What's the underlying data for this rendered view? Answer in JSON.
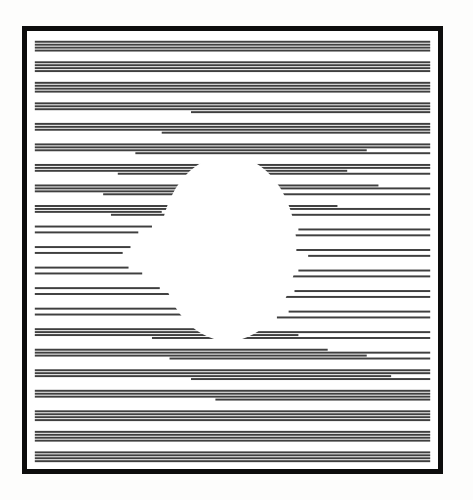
{
  "artwork": {
    "title": "Horizontal Line Optical Illusion",
    "description": "Black rectangular frame enclosing stacked horizontal line pairs that part around a central oval void, producing a sphere-like figure-ground illusion.",
    "style_name": "op-art-line-drawing",
    "canvas": {
      "width": 473,
      "height": 500,
      "background_color": "#fdfdfc"
    },
    "frame": {
      "name": "black-rectangular-border",
      "left": 22,
      "top": 26,
      "width": 421,
      "height": 448,
      "border_width": 5,
      "border_color": "#0d0d0d",
      "inner_inset": 3,
      "fill_color": "#ffffff"
    },
    "plate": {
      "left": 30,
      "top": 34,
      "width": 405,
      "height": 432,
      "background_color": "#ffffff"
    },
    "stripes": {
      "name": "horizontal-stripe-field",
      "color": "#3f3f3f",
      "thickness": 2,
      "pair_gap": 4,
      "group_gap": 11,
      "group_count": 28,
      "lines_per_group": 2,
      "first_group_top": 36
    },
    "void": {
      "name": "central-oval-void",
      "shape": "oval",
      "center_x": 228,
      "center_y": 248,
      "radius_x": 70,
      "radius_y": 95,
      "fill_color": "#ffffff",
      "top_notch_depth": 18,
      "bottom_notch_depth": 14
    },
    "chart_data": {
      "type": "line",
      "title": "Horizontal Line Optical Illusion",
      "xlabel": "",
      "ylabel": "",
      "xlim": [
        30,
        435
      ],
      "ylim": [
        34,
        466
      ],
      "grid": false,
      "legend": "none",
      "note": "Each row is a pair of stripes. left_end = x where the left-anchored stripe stops; right_start = x where the right-anchored stripe begins. Full-width rows use left_end 435 and right_start 30.",
      "rows": [
        {
          "y": 36,
          "left_end": 435,
          "right_start": 30
        },
        {
          "y": 42,
          "left_end": 435,
          "right_start": 30
        },
        {
          "y": 57,
          "left_end": 435,
          "right_start": 30
        },
        {
          "y": 63,
          "left_end": 435,
          "right_start": 30
        },
        {
          "y": 78,
          "left_end": 435,
          "right_start": 30
        },
        {
          "y": 84,
          "left_end": 435,
          "right_start": 30
        },
        {
          "y": 99,
          "left_end": 435,
          "right_start": 30
        },
        {
          "y": 105,
          "left_end": 435,
          "right_start": 190
        },
        {
          "y": 120,
          "left_end": 435,
          "right_start": 30
        },
        {
          "y": 126,
          "left_end": 435,
          "right_start": 160
        },
        {
          "y": 141,
          "left_end": 435,
          "right_start": 30
        },
        {
          "y": 147,
          "left_end": 370,
          "right_start": 133
        },
        {
          "y": 162,
          "left_end": 435,
          "right_start": 30
        },
        {
          "y": 168,
          "left_end": 350,
          "right_start": 115
        },
        {
          "y": 183,
          "left_end": 382,
          "right_start": 30
        },
        {
          "y": 189,
          "left_end": 205,
          "right_start": 100
        },
        {
          "y": 204,
          "left_end": 340,
          "right_start": 30
        },
        {
          "y": 210,
          "left_end": 160,
          "right_start": 108
        },
        {
          "y": 225,
          "left_end": 150,
          "right_start": 300
        },
        {
          "y": 231,
          "left_end": 136,
          "right_start": 280
        },
        {
          "y": 246,
          "left_end": 128,
          "right_start": 290
        },
        {
          "y": 252,
          "left_end": 120,
          "right_start": 310
        },
        {
          "y": 267,
          "left_end": 126,
          "right_start": 300
        },
        {
          "y": 273,
          "left_end": 140,
          "right_start": 285
        },
        {
          "y": 288,
          "left_end": 158,
          "right_start": 296
        },
        {
          "y": 294,
          "left_end": 196,
          "right_start": 272
        },
        {
          "y": 309,
          "left_end": 205,
          "right_start": 290
        },
        {
          "y": 315,
          "left_end": 258,
          "right_start": 278
        },
        {
          "y": 330,
          "left_end": 240,
          "right_start": 30
        },
        {
          "y": 336,
          "left_end": 300,
          "right_start": 150
        },
        {
          "y": 351,
          "left_end": 330,
          "right_start": 30
        },
        {
          "y": 357,
          "left_end": 370,
          "right_start": 168
        },
        {
          "y": 372,
          "left_end": 435,
          "right_start": 30
        },
        {
          "y": 378,
          "left_end": 395,
          "right_start": 190
        },
        {
          "y": 393,
          "left_end": 435,
          "right_start": 30
        },
        {
          "y": 399,
          "left_end": 435,
          "right_start": 215
        },
        {
          "y": 414,
          "left_end": 435,
          "right_start": 30
        },
        {
          "y": 420,
          "left_end": 435,
          "right_start": 30
        },
        {
          "y": 435,
          "left_end": 435,
          "right_start": 30
        },
        {
          "y": 441,
          "left_end": 435,
          "right_start": 30
        },
        {
          "y": 456,
          "left_end": 435,
          "right_start": 30
        },
        {
          "y": 462,
          "left_end": 435,
          "right_start": 30
        }
      ]
    }
  }
}
